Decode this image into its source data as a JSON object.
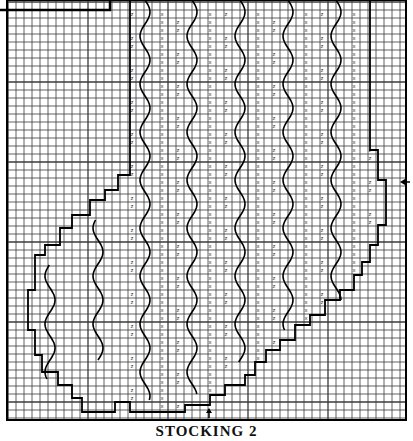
{
  "caption": "STOCKING 2",
  "colors": {
    "grid": "#3a3a3a",
    "outline": "#000000",
    "background": "#ffffff",
    "symbol": "#333333"
  },
  "grid": {
    "origin_x": 8,
    "origin_y": 2,
    "cell": 8,
    "cols": 50,
    "rows": 52,
    "frame": {
      "x": 7,
      "y": 0,
      "width": 399,
      "height": 420
    },
    "inset_box": {
      "x": 0,
      "y": 0,
      "width": 110,
      "height": 10
    }
  },
  "markers": [
    {
      "name": "side-arrow",
      "direction": "left",
      "x": 410,
      "y": 182
    },
    {
      "name": "bottom-arrow",
      "direction": "up",
      "x": 209,
      "y": 418
    }
  ],
  "legend_symbols": [
    {
      "symbol": "x",
      "meaning": "cross stitch"
    },
    {
      "symbol": "z",
      "meaning": "z stitch"
    }
  ],
  "wavy_columns": [
    {
      "x": 145,
      "y0": 0,
      "y1": 400
    },
    {
      "x": 192,
      "y0": 0,
      "y1": 395
    },
    {
      "x": 240,
      "y0": 0,
      "y1": 363
    },
    {
      "x": 288,
      "y0": 0,
      "y1": 330
    },
    {
      "x": 336,
      "y0": 0,
      "y1": 300
    },
    {
      "x": 98,
      "y0": 220,
      "y1": 360
    },
    {
      "x": 50,
      "y0": 265,
      "y1": 380
    }
  ],
  "outline_polygon": [
    [
      370,
      0
    ],
    [
      370,
      150
    ],
    [
      378,
      150
    ],
    [
      378,
      180
    ],
    [
      386,
      180
    ],
    [
      386,
      225
    ],
    [
      378,
      225
    ],
    [
      378,
      245
    ],
    [
      370,
      245
    ],
    [
      370,
      262
    ],
    [
      362,
      262
    ],
    [
      362,
      275
    ],
    [
      354,
      275
    ],
    [
      354,
      290
    ],
    [
      340,
      290
    ],
    [
      340,
      300
    ],
    [
      325,
      300
    ],
    [
      325,
      315
    ],
    [
      310,
      315
    ],
    [
      310,
      325
    ],
    [
      295,
      325
    ],
    [
      295,
      340
    ],
    [
      280,
      340
    ],
    [
      280,
      350
    ],
    [
      266,
      350
    ],
    [
      266,
      362
    ],
    [
      255,
      362
    ],
    [
      255,
      375
    ],
    [
      245,
      375
    ],
    [
      245,
      385
    ],
    [
      225,
      385
    ],
    [
      225,
      395
    ],
    [
      210,
      395
    ],
    [
      210,
      405
    ],
    [
      185,
      405
    ],
    [
      185,
      412
    ],
    [
      130,
      412
    ],
    [
      130,
      402
    ],
    [
      115,
      402
    ],
    [
      115,
      412
    ],
    [
      82,
      412
    ],
    [
      82,
      398
    ],
    [
      72,
      398
    ],
    [
      72,
      385
    ],
    [
      58,
      385
    ],
    [
      58,
      372
    ],
    [
      42,
      372
    ],
    [
      42,
      355
    ],
    [
      35,
      355
    ],
    [
      35,
      330
    ],
    [
      28,
      330
    ],
    [
      28,
      290
    ],
    [
      35,
      290
    ],
    [
      35,
      255
    ],
    [
      45,
      255
    ],
    [
      45,
      245
    ],
    [
      60,
      245
    ],
    [
      60,
      228
    ],
    [
      72,
      228
    ],
    [
      72,
      215
    ],
    [
      90,
      215
    ],
    [
      90,
      200
    ],
    [
      105,
      200
    ],
    [
      105,
      190
    ],
    [
      118,
      190
    ],
    [
      118,
      175
    ],
    [
      130,
      175
    ],
    [
      130,
      0
    ]
  ],
  "symbols_x_columns": [
    162,
    210,
    258,
    306,
    354
  ],
  "symbols_z_columns": [
    132,
    178,
    226,
    274,
    322,
    370
  ],
  "symbol_rows": {
    "start": 14,
    "step": 16,
    "count": 25
  }
}
